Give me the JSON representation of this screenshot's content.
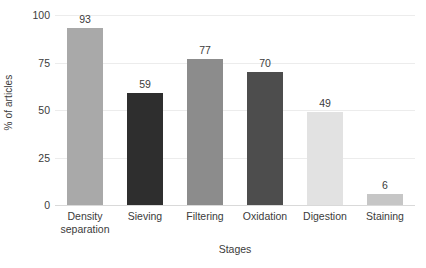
{
  "chart_data": {
    "type": "bar",
    "title": "",
    "xlabel": "Stages",
    "ylabel": "% of articles",
    "categories": [
      "Density separation",
      "Sieving",
      "Filtering",
      "Oxidation",
      "Digestion",
      "Staining"
    ],
    "values": [
      93,
      59,
      77,
      70,
      49,
      6
    ],
    "value_labels": [
      "93",
      "59",
      "77",
      "70",
      "49",
      "6"
    ],
    "bar_colors": [
      "#a9a9a9",
      "#2e2e2e",
      "#8c8c8c",
      "#4d4d4d",
      "#e2e2e2",
      "#c6c6c6"
    ],
    "ylim": [
      0,
      100
    ],
    "yticks": [
      0,
      25,
      50,
      75,
      100
    ],
    "ytick_labels": [
      "0",
      "25",
      "50",
      "75",
      "100"
    ],
    "grid": true,
    "grid_color": "#ececec",
    "legend": "none",
    "background": "#ffffff",
    "text_color": "#3b3b3b"
  }
}
